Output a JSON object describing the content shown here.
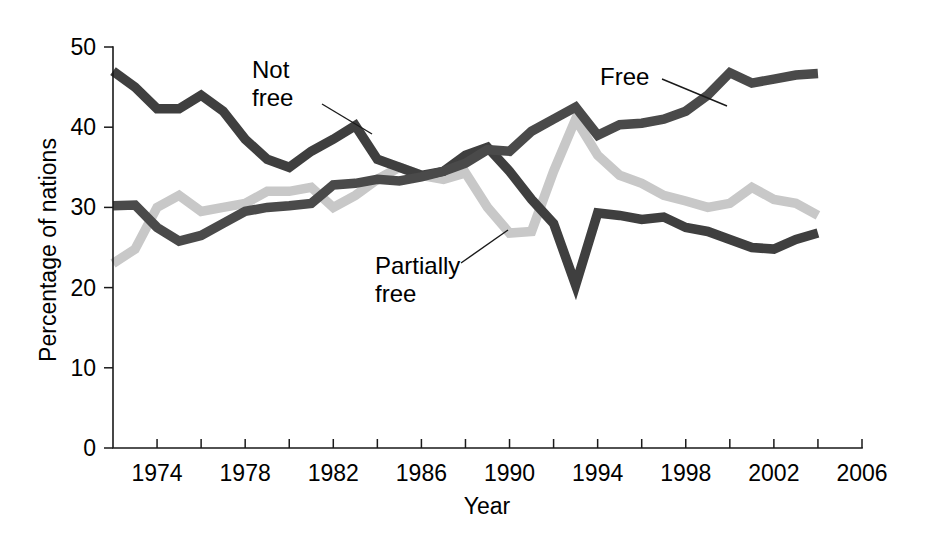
{
  "chart_data": {
    "type": "line",
    "title": "",
    "xlabel": "Year",
    "ylabel": "Percentage of nations",
    "xlim": [
      1972,
      2006
    ],
    "ylim": [
      0,
      50
    ],
    "grid": false,
    "legend_position": "inline-annotations",
    "x_tick_labels": [
      "1974",
      "1978",
      "1982",
      "1986",
      "1990",
      "1994",
      "1998",
      "2002",
      "2006"
    ],
    "x_major_ticks": [
      1974,
      1978,
      1982,
      1986,
      1990,
      1994,
      1998,
      2002,
      2006
    ],
    "x_minor_ticks": [
      1976,
      1980,
      1984,
      1988,
      1992,
      1996,
      2000,
      2004
    ],
    "y_tick_labels": [
      "0",
      "10",
      "20",
      "30",
      "40",
      "50"
    ],
    "y_ticks": [
      0,
      10,
      20,
      30,
      40,
      50
    ],
    "x": [
      1972,
      1973,
      1974,
      1975,
      1976,
      1977,
      1978,
      1979,
      1980,
      1981,
      1982,
      1983,
      1984,
      1985,
      1986,
      1987,
      1988,
      1989,
      1990,
      1991,
      1992,
      1993,
      1994,
      1995,
      1996,
      1997,
      1998,
      1999,
      2000,
      2001,
      2002,
      2003,
      2004
    ],
    "series": [
      {
        "name": "Not free",
        "color": "#3f3f3f",
        "values": [
          47.0,
          45.0,
          42.3,
          42.3,
          44.0,
          42.0,
          38.5,
          36.0,
          35.0,
          37.0,
          38.5,
          40.2,
          36.0,
          35.0,
          34.0,
          34.5,
          36.5,
          37.5,
          34.5,
          31.0,
          28.0,
          20.3,
          29.3,
          29.0,
          28.5,
          28.8,
          27.5,
          27.0,
          26.0,
          25.0,
          24.8,
          26.0,
          26.8
        ]
      },
      {
        "name": "Free",
        "color": "#4a4a4a",
        "values": [
          30.2,
          30.3,
          27.5,
          25.8,
          26.5,
          28.0,
          29.5,
          30.0,
          30.2,
          30.5,
          32.8,
          33.0,
          33.5,
          33.3,
          33.8,
          34.5,
          35.5,
          37.2,
          37.0,
          39.5,
          41.0,
          42.5,
          39.0,
          40.3,
          40.5,
          41.0,
          42.0,
          44.0,
          46.8,
          45.5,
          46.0,
          46.5,
          46.7
        ]
      },
      {
        "name": "Partially free",
        "color": "#c8c8c8",
        "values": [
          23.0,
          24.8,
          30.0,
          31.5,
          29.5,
          30.0,
          30.5,
          32.0,
          32.0,
          32.5,
          30.0,
          31.5,
          33.5,
          35.0,
          34.0,
          33.5,
          34.3,
          30.0,
          26.8,
          27.0,
          34.5,
          41.0,
          36.5,
          34.0,
          33.0,
          31.5,
          30.8,
          30.0,
          30.5,
          32.5,
          31.0,
          30.5,
          29.0
        ]
      }
    ],
    "annotations": [
      {
        "label_lines": [
          "Not",
          "free"
        ],
        "target_series": "Not free",
        "text_x": 252,
        "text_y": 78,
        "leader": {
          "x1": 322,
          "y1": 104,
          "x2": 372,
          "y2": 134
        }
      },
      {
        "label_lines": [
          "Free"
        ],
        "target_series": "Free",
        "text_x": 600,
        "text_y": 85,
        "leader": {
          "x1": 662,
          "y1": 79,
          "x2": 727,
          "y2": 106
        }
      },
      {
        "label_lines": [
          "Partially",
          "free"
        ],
        "target_series": "Partially free",
        "text_x": 375,
        "text_y": 274,
        "leader": {
          "x1": 461,
          "y1": 263,
          "x2": 508,
          "y2": 230
        }
      }
    ]
  },
  "plot_geometry": {
    "left": 113,
    "right": 862,
    "top": 47,
    "bottom": 448,
    "x_pixels_per_year": 22.03,
    "note_axis_style": "open-L axis, ticks outside"
  }
}
